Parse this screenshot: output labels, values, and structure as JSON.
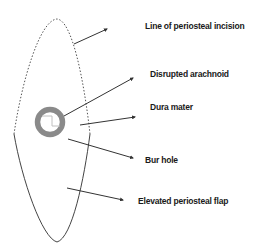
{
  "diagram": {
    "labels": {
      "incision": "Line of periosteal incision",
      "arachnoid": "Disrupted arachnoid",
      "dura": "Dura mater",
      "burhole": "Bur hole",
      "flap": "Elevated periosteal flap"
    },
    "colors": {
      "line": "#333333",
      "ring": "#8a8a8a",
      "inner": "#bdbdbd",
      "text": "#1a1a1a"
    }
  }
}
